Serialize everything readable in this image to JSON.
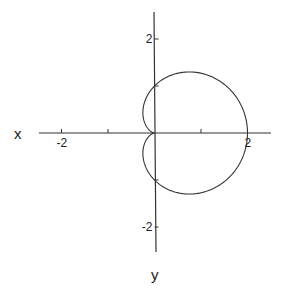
{
  "chart_data": {
    "type": "line",
    "title": "",
    "xlabel": "x",
    "ylabel": "y",
    "curve": "cardioid r = 1 + cos(theta)",
    "equation": {
      "r": "1 + cos(theta)",
      "theta_range": [
        0,
        6.2832
      ]
    },
    "xlim": [
      -2.5,
      2.5
    ],
    "ylim": [
      -2.6,
      2.6
    ],
    "x_ticks": [
      -2,
      -1,
      1,
      2
    ],
    "x_tick_labels": [
      {
        "value": -2,
        "label": "-2"
      },
      {
        "value": 2,
        "label": "2"
      }
    ],
    "y_ticks": [
      -2,
      -1,
      1,
      2
    ],
    "y_tick_labels": [
      {
        "value": 2,
        "label": "2"
      },
      {
        "value": -2,
        "label": "-2"
      }
    ],
    "key_points": [
      {
        "x": 2,
        "y": 0
      },
      {
        "x": 0,
        "y": 1
      },
      {
        "x": 0,
        "y": -1
      },
      {
        "x": 0.75,
        "y": 1.3
      },
      {
        "x": 0.75,
        "y": -1.3
      },
      {
        "x": 0,
        "y": 0
      }
    ],
    "grid": false,
    "legend": null
  },
  "axes": {
    "x_label": "x",
    "y_label": "y"
  },
  "style": {
    "line_color": "#333333",
    "axis_color": "#333333",
    "background": "#ffffff"
  }
}
